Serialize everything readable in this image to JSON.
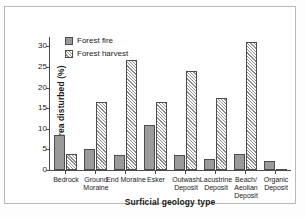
{
  "chart_data": {
    "type": "bar",
    "title": "",
    "xlabel": "Surficial geology type",
    "ylabel": "Area disturbed (%)",
    "ylim": [
      0,
      32
    ],
    "yticks": [
      0,
      5,
      10,
      15,
      20,
      25,
      30
    ],
    "grid": false,
    "legend_position": "top-left",
    "categories": [
      "Bedrock",
      "Ground Moraine",
      "End Moraine",
      "Esker",
      "Outwash Deposit",
      "Lacustrine Deposit",
      "Beach/ Aeolian Deposit",
      "Organic Deposit"
    ],
    "series": [
      {
        "name": "Forest fire",
        "color": "#9a9a9a",
        "pattern": "solid",
        "values": [
          8.6,
          5.1,
          3.7,
          10.9,
          3.6,
          2.7,
          3.9,
          2.1
        ]
      },
      {
        "name": "Forest harvest",
        "color": "#8f8f8f",
        "pattern": "diagonal-hatch",
        "values": [
          3.9,
          16.6,
          26.7,
          16.4,
          23.9,
          17.5,
          31.0,
          0.15
        ]
      }
    ]
  },
  "axes": {
    "y_label": "Area disturbed (%)",
    "x_label": "Surficial geology type",
    "y_tick_labels": [
      "0",
      "5",
      "10",
      "15",
      "20",
      "25",
      "30"
    ]
  },
  "legend": {
    "items": [
      {
        "label": "Forest fire"
      },
      {
        "label": "Forest harvest"
      }
    ]
  },
  "colors": {
    "bar_fire_fill": "#9a9a9a",
    "bar_outline": "#4d4d4d",
    "axis": "#4a4a4a",
    "frame_border": "#b9b9b9",
    "background": "#ffffff"
  }
}
